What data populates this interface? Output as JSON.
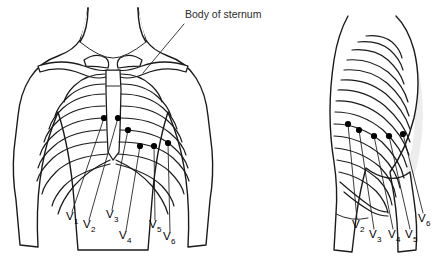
{
  "figure": {
    "background_color": "#ffffff",
    "line_color": "#1a1a1a",
    "electrode_color": "#000000",
    "shading_color": "#d9d9d9",
    "width": 442,
    "height": 257
  },
  "annotations": [
    {
      "id": "body-of-sternum",
      "text": "Body of sternum",
      "x": 185,
      "y": 18
    }
  ],
  "panels": [
    {
      "id": "anterior-view",
      "name": "anterior-chest-view",
      "description": "Frontal view of the chest showing clavicles, sternum and rib cage with six precordial electrodes",
      "electrodes": [
        {
          "label": "V",
          "subscript": "1",
          "dot_x": 104,
          "dot_y": 118,
          "label_x": 66,
          "label_y": 220
        },
        {
          "label": "V",
          "subscript": "2",
          "dot_x": 118,
          "dot_y": 118,
          "label_x": 83,
          "label_y": 228
        },
        {
          "label": "V",
          "subscript": "3",
          "dot_x": 128,
          "dot_y": 130,
          "label_x": 106,
          "label_y": 218
        },
        {
          "label": "V",
          "subscript": "4",
          "dot_x": 140,
          "dot_y": 146,
          "label_x": 119,
          "label_y": 239
        },
        {
          "label": "V",
          "subscript": "5",
          "dot_x": 154,
          "dot_y": 146,
          "label_x": 149,
          "label_y": 228
        },
        {
          "label": "V",
          "subscript": "6",
          "dot_x": 168,
          "dot_y": 143,
          "label_x": 163,
          "label_y": 240
        }
      ]
    },
    {
      "id": "lateral-view",
      "name": "lateral-chest-view",
      "description": "Side view of the chest showing the rib cage with five visible precordial electrodes",
      "electrodes": [
        {
          "label": "V",
          "subscript": "2",
          "dot_x": 348,
          "dot_y": 124,
          "label_x": 352,
          "label_y": 228
        },
        {
          "label": "V",
          "subscript": "3",
          "dot_x": 359,
          "dot_y": 130,
          "label_x": 369,
          "label_y": 238
        },
        {
          "label": "V",
          "subscript": "4",
          "dot_x": 374,
          "dot_y": 136,
          "label_x": 388,
          "label_y": 238
        },
        {
          "label": "V",
          "subscript": "5",
          "dot_x": 389,
          "dot_y": 136,
          "label_x": 405,
          "label_y": 238
        },
        {
          "label": "V",
          "subscript": "6",
          "dot_x": 403,
          "dot_y": 134,
          "label_x": 418,
          "label_y": 222
        }
      ]
    }
  ]
}
